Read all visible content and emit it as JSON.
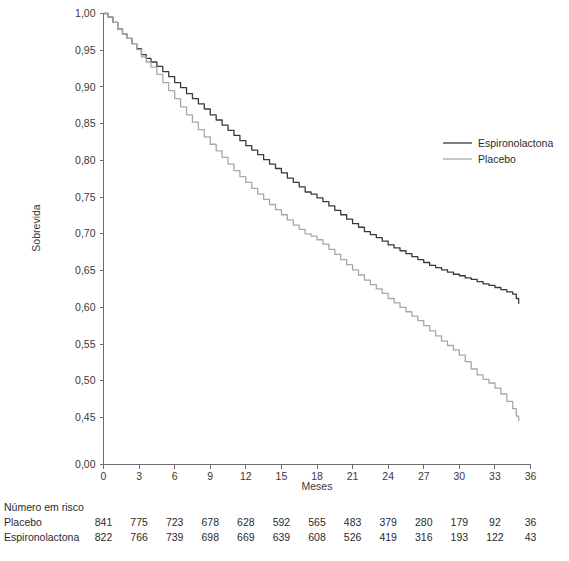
{
  "chart_data": {
    "type": "line",
    "title": "",
    "xlabel": "Meses",
    "ylabel": "Sobrevida",
    "xlim": [
      0,
      36
    ],
    "ylim": [
      0.45,
      1.0
    ],
    "y_axis_break": true,
    "y_axis_break_label": "0,00",
    "grid": false,
    "legend_position": "right-upper",
    "xticks": [
      "0",
      "3",
      "6",
      "9",
      "12",
      "15",
      "18",
      "21",
      "24",
      "27",
      "30",
      "33",
      "36"
    ],
    "xtick_values": [
      0,
      3,
      6,
      9,
      12,
      15,
      18,
      21,
      24,
      27,
      30,
      33,
      36
    ],
    "yticks": [
      "1,00",
      "0,95",
      "0,90",
      "0,85",
      "0,80",
      "0,75",
      "0,70",
      "0,65",
      "0,60",
      "0,55",
      "0,50",
      "0,45",
      "0,00"
    ],
    "ytick_values": [
      1.0,
      0.95,
      0.9,
      0.85,
      0.8,
      0.75,
      0.7,
      0.65,
      0.6,
      0.55,
      0.5,
      0.45,
      0.0
    ],
    "series": [
      {
        "name": "Espironolactona",
        "color": "#3a3a3a",
        "x": [
          0,
          0.4,
          0.8,
          1.2,
          1.6,
          2.0,
          2.4,
          2.8,
          3.2,
          3.6,
          4.0,
          4.5,
          5.0,
          5.5,
          6.0,
          6.5,
          7.0,
          7.5,
          8.0,
          8.5,
          9.0,
          9.5,
          10.0,
          10.5,
          11.0,
          11.5,
          12.0,
          12.5,
          13.0,
          13.5,
          14.0,
          14.5,
          15.0,
          15.5,
          16.0,
          16.5,
          17.0,
          17.5,
          18.0,
          18.5,
          19.0,
          19.5,
          20.0,
          20.5,
          21.0,
          21.5,
          22.0,
          22.5,
          23.0,
          23.5,
          24.0,
          24.5,
          25.0,
          25.5,
          26.0,
          26.5,
          27.0,
          27.5,
          28.0,
          28.5,
          29.0,
          29.5,
          30.0,
          30.5,
          31.0,
          31.5,
          32.0,
          32.5,
          33.0,
          33.5,
          34.0,
          34.5,
          34.8,
          35.0
        ],
        "y": [
          1.0,
          0.995,
          0.988,
          0.979,
          0.972,
          0.966,
          0.959,
          0.952,
          0.944,
          0.939,
          0.934,
          0.928,
          0.921,
          0.914,
          0.906,
          0.899,
          0.891,
          0.884,
          0.877,
          0.87,
          0.862,
          0.855,
          0.848,
          0.841,
          0.834,
          0.827,
          0.82,
          0.814,
          0.808,
          0.801,
          0.795,
          0.789,
          0.783,
          0.776,
          0.77,
          0.764,
          0.757,
          0.754,
          0.749,
          0.744,
          0.738,
          0.732,
          0.726,
          0.72,
          0.714,
          0.709,
          0.703,
          0.699,
          0.695,
          0.69,
          0.685,
          0.681,
          0.677,
          0.673,
          0.669,
          0.665,
          0.661,
          0.657,
          0.654,
          0.651,
          0.648,
          0.645,
          0.643,
          0.64,
          0.638,
          0.635,
          0.632,
          0.63,
          0.627,
          0.624,
          0.621,
          0.618,
          0.612,
          0.605
        ]
      },
      {
        "name": "Placebo",
        "color": "#a8a8a8",
        "x": [
          0,
          0.4,
          0.8,
          1.2,
          1.6,
          2.0,
          2.4,
          2.8,
          3.2,
          3.6,
          4.0,
          4.5,
          5.0,
          5.5,
          6.0,
          6.5,
          7.0,
          7.5,
          8.0,
          8.5,
          9.0,
          9.5,
          10.0,
          10.5,
          11.0,
          11.5,
          12.0,
          12.5,
          13.0,
          13.5,
          14.0,
          14.5,
          15.0,
          15.5,
          16.0,
          16.5,
          17.0,
          17.5,
          18.0,
          18.5,
          19.0,
          19.5,
          20.0,
          20.5,
          21.0,
          21.5,
          22.0,
          22.5,
          23.0,
          23.5,
          24.0,
          24.5,
          25.0,
          25.5,
          26.0,
          26.5,
          27.0,
          27.5,
          28.0,
          28.5,
          29.0,
          29.5,
          30.0,
          30.5,
          31.0,
          31.5,
          32.0,
          32.5,
          33.0,
          33.5,
          34.0,
          34.5,
          34.8,
          35.0
        ],
        "y": [
          1.0,
          0.995,
          0.988,
          0.979,
          0.972,
          0.966,
          0.959,
          0.951,
          0.941,
          0.934,
          0.927,
          0.917,
          0.906,
          0.895,
          0.884,
          0.873,
          0.862,
          0.852,
          0.842,
          0.832,
          0.822,
          0.813,
          0.804,
          0.795,
          0.786,
          0.778,
          0.77,
          0.762,
          0.754,
          0.747,
          0.74,
          0.733,
          0.726,
          0.719,
          0.712,
          0.706,
          0.7,
          0.697,
          0.692,
          0.686,
          0.679,
          0.672,
          0.665,
          0.658,
          0.651,
          0.644,
          0.637,
          0.631,
          0.625,
          0.619,
          0.612,
          0.606,
          0.6,
          0.594,
          0.588,
          0.582,
          0.575,
          0.568,
          0.561,
          0.554,
          0.548,
          0.542,
          0.535,
          0.526,
          0.516,
          0.508,
          0.502,
          0.497,
          0.49,
          0.482,
          0.472,
          0.462,
          0.452,
          0.445
        ]
      }
    ]
  },
  "legend": {
    "items": [
      {
        "label": "Espironolactona",
        "color": "#3a3a3a"
      },
      {
        "label": "Placebo",
        "color": "#a8a8a8"
      }
    ]
  },
  "risk_table": {
    "title": "Número em risco",
    "rows": [
      {
        "label": "Placebo",
        "values": [
          "841",
          "775",
          "723",
          "678",
          "628",
          "592",
          "565",
          "483",
          "379",
          "280",
          "179",
          "92",
          "36"
        ]
      },
      {
        "label": "Espironolactona",
        "values": [
          "822",
          "766",
          "739",
          "698",
          "669",
          "639",
          "608",
          "526",
          "419",
          "316",
          "193",
          "122",
          "43"
        ]
      }
    ]
  }
}
